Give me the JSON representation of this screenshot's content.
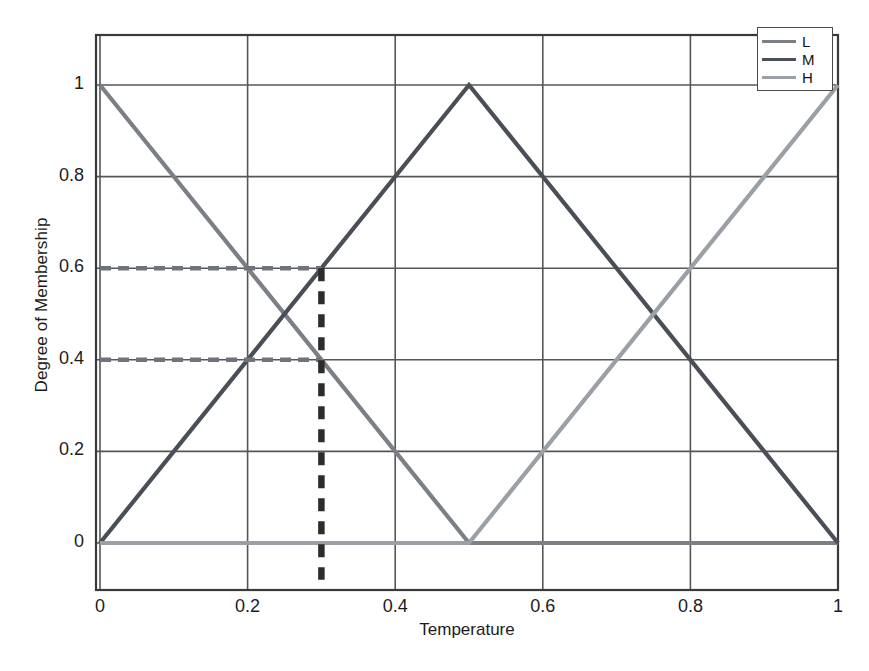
{
  "chart_data": {
    "type": "line",
    "title": "",
    "xlabel": "Temperature",
    "ylabel": "Degree of Membership",
    "xlim": [
      0,
      1
    ],
    "ylim": [
      0,
      1
    ],
    "xticks": [
      "0",
      "0.2",
      "0.4",
      "0.6",
      "0.8",
      "1"
    ],
    "xtick_values": [
      0,
      0.2,
      0.4,
      0.6,
      0.8,
      1
    ],
    "yticks": [
      "0",
      "0.2",
      "0.4",
      "0.6",
      "0.8",
      "1"
    ],
    "ytick_values": [
      0,
      0.2,
      0.4,
      0.6,
      0.8,
      1
    ],
    "grid": true,
    "legend_position": "top-right",
    "series": [
      {
        "name": "L",
        "color": "#7b7f86",
        "x": [
          0,
          0.5,
          1
        ],
        "y": [
          1,
          0,
          0
        ]
      },
      {
        "name": "M",
        "color": "#4a4f57",
        "x": [
          0,
          0.5,
          1
        ],
        "y": [
          0,
          1,
          0
        ]
      },
      {
        "name": "H",
        "color": "#9aa0a6",
        "x": [
          0,
          0.5,
          1
        ],
        "y": [
          0,
          0,
          1
        ]
      }
    ],
    "annotations": [
      {
        "name": "membership-level-high",
        "type": "hline",
        "value": 0.6,
        "x_from": 0,
        "x_to": 0.3,
        "style": "dashed",
        "color": "#6f747b"
      },
      {
        "name": "membership-level-low",
        "type": "vline-marker",
        "value": 0.4,
        "x_from": 0,
        "x_to": 0.3,
        "style": "dashed",
        "color": "#6f747b"
      },
      {
        "name": "input-temperature",
        "type": "vline",
        "value": 0.3,
        "y_from": -0.08,
        "y_to": 0.6,
        "style": "dashed",
        "color": "#2c2c2c"
      }
    ],
    "legend": [
      {
        "label": "L",
        "color": "#7b7f86"
      },
      {
        "label": "M",
        "color": "#4a4f57"
      },
      {
        "label": "H",
        "color": "#9aa0a6"
      }
    ]
  },
  "axes": {
    "x_title": "Temperature",
    "y_title": "Degree of Membership"
  },
  "colors": {
    "frame": "#3a3a3a",
    "grid": "#565656",
    "background": "#ffffff",
    "series_l": "#7b7f86",
    "series_m": "#4a4f57",
    "series_h": "#9aa0a6",
    "annotation": "#2c2c2c"
  }
}
